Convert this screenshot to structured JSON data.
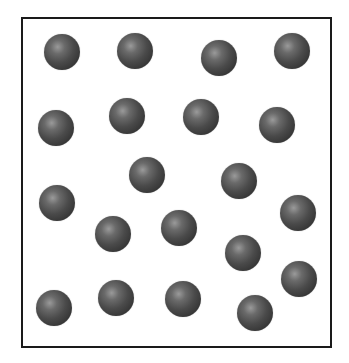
{
  "diagram": {
    "container": {
      "left": 21,
      "top": 17,
      "right": 331,
      "bottom": 347,
      "border_color": "#1a1a1a",
      "background": "#ffffff"
    },
    "particle": {
      "diameter": 36,
      "base_color": "#333333",
      "highlight_color": "#9a9a9a"
    },
    "particles": [
      {
        "x": 62,
        "y": 52
      },
      {
        "x": 135,
        "y": 51
      },
      {
        "x": 219,
        "y": 58
      },
      {
        "x": 292,
        "y": 51
      },
      {
        "x": 56,
        "y": 128
      },
      {
        "x": 127,
        "y": 116
      },
      {
        "x": 201,
        "y": 117
      },
      {
        "x": 277,
        "y": 125
      },
      {
        "x": 147,
        "y": 175
      },
      {
        "x": 239,
        "y": 181
      },
      {
        "x": 57,
        "y": 203
      },
      {
        "x": 298,
        "y": 213
      },
      {
        "x": 179,
        "y": 228
      },
      {
        "x": 113,
        "y": 234
      },
      {
        "x": 243,
        "y": 253
      },
      {
        "x": 299,
        "y": 279
      },
      {
        "x": 54,
        "y": 308
      },
      {
        "x": 116,
        "y": 298
      },
      {
        "x": 183,
        "y": 299
      },
      {
        "x": 255,
        "y": 313
      }
    ]
  }
}
